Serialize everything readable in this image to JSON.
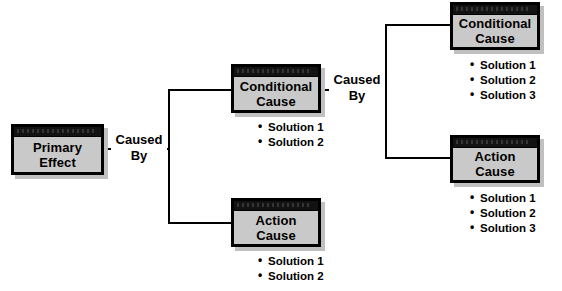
{
  "diagram": {
    "type": "tree",
    "colors": {
      "box_body": "#c9c9c9",
      "box_header": "#121212",
      "box_border": "#000000",
      "shadow": "#c0c0c0",
      "line": "#000000",
      "text": "#000000",
      "background": "#ffffff"
    },
    "nodes": [
      {
        "id": "primary-effect",
        "line1": "Primary",
        "line2": "Effect",
        "solutions": []
      },
      {
        "id": "conditional-cause-level2",
        "line1": "Conditional",
        "line2": "Cause",
        "solutions": [
          "Solution 1",
          "Solution 2"
        ]
      },
      {
        "id": "action-cause-level2",
        "line1": "Action",
        "line2": "Cause",
        "solutions": [
          "Solution 1",
          "Solution 2"
        ]
      },
      {
        "id": "conditional-cause-level3",
        "line1": "Conditional",
        "line2": "Cause",
        "solutions": [
          "Solution 1",
          "Solution 2",
          "Solution 3"
        ]
      },
      {
        "id": "action-cause-level3",
        "line1": "Action",
        "line2": "Cause",
        "solutions": [
          "Solution 1",
          "Solution 2",
          "Solution 3"
        ]
      }
    ],
    "connectors": [
      {
        "id": "caused-by-1",
        "word1": "Caused",
        "word2": "By"
      },
      {
        "id": "caused-by-2",
        "word1": "Caused",
        "word2": "By"
      }
    ]
  }
}
